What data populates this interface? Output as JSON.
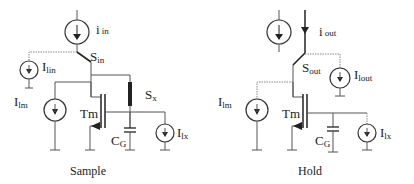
{
  "diagram": {
    "type": "current-mode sample-and-hold circuit",
    "panels": [
      {
        "name": "sample",
        "caption": "Sample",
        "labels": {
          "i_in": {
            "main": "i",
            "sub": "in"
          },
          "S_in": {
            "main": "S",
            "sub": "in"
          },
          "I_lin": {
            "main": "I",
            "sub": "lin"
          },
          "I_lm": {
            "main": "I",
            "sub": "lm"
          },
          "Tm": {
            "main": "Tm"
          },
          "S_x": {
            "main": "S",
            "sub": "x"
          },
          "C_G": {
            "main": "C",
            "sub": "G"
          },
          "I_lx": {
            "main": "I",
            "sub": "lx"
          }
        }
      },
      {
        "name": "hold",
        "caption": "Hold",
        "labels": {
          "i_out": {
            "main": "i",
            "sub": "out"
          },
          "S_out": {
            "main": "S",
            "sub": "out"
          },
          "I_lout": {
            "main": "I",
            "sub": "lout"
          },
          "I_lm": {
            "main": "I",
            "sub": "lm"
          },
          "Tm": {
            "main": "Tm"
          },
          "C_G": {
            "main": "C",
            "sub": "G"
          },
          "I_lx": {
            "main": "I",
            "sub": "lx"
          }
        }
      }
    ],
    "colors": {
      "wire": "#555555",
      "text": "#222222",
      "background": "#ffffff"
    }
  }
}
